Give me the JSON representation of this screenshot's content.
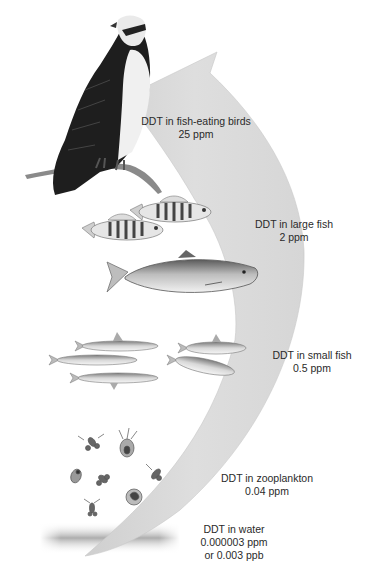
{
  "colors": {
    "arrow": "#dcdcdc",
    "arrow_edge": "#c4c4c4",
    "text": "#2a2a2a",
    "background": "#ffffff"
  },
  "levels": [
    {
      "organism": "fish-eating birds",
      "line1": "DDT in fish-eating birds",
      "line2": "25 ppm",
      "image": "osprey-on-branch"
    },
    {
      "organism": "large fish",
      "line1": "DDT in large fish",
      "line2": "2 ppm",
      "image": "perch-and-salmon"
    },
    {
      "organism": "small fish",
      "line1": "DDT in small fish",
      "line2": "0.5 ppm",
      "image": "small-fish-school"
    },
    {
      "organism": "zooplankton",
      "line1": "DDT in zooplankton",
      "line2": "0.04 ppm",
      "image": "zooplankton-cluster"
    },
    {
      "organism": "water",
      "line1": "DDT in water",
      "line2": "0.000003 ppm",
      "line3": "or 0.003 ppb",
      "image": "water-surface"
    }
  ]
}
